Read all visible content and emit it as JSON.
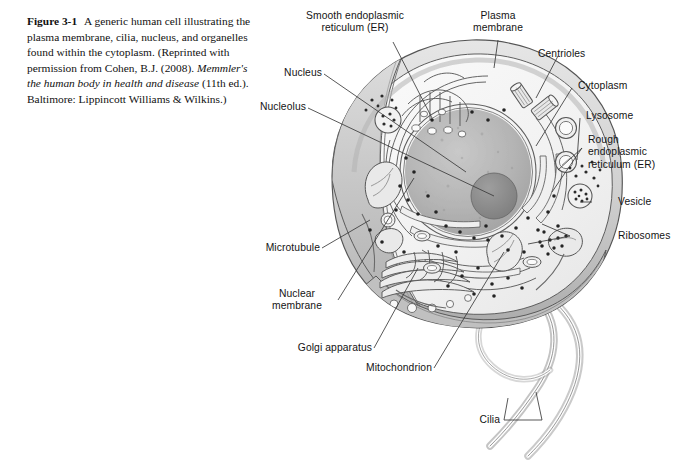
{
  "figure": {
    "number": "Figure 3-1",
    "caption_text": "A generic human cell illustrating the plasma membrane, cilia, nucleus, and organelles found within the cytoplasm. (Reprinted with permission from Cohen, B.J. (2008). ",
    "caption_italic": "Memmler's the human body in health and disease",
    "caption_tail": " (11th ed.). Baltimore: Lippincott Williams & Wilkins.)",
    "alt": "Grayscale illustration of a generic human cell in cross-section showing the nucleus, nucleolus, endoplasmic reticulum, Golgi apparatus, mitochondria, lysosomes, centrioles, ribosomes, vesicles, microtubules and cilia."
  },
  "labels": {
    "smooth_er": "Smooth endoplasmic\nreticulum (ER)",
    "smooth_er_l1": "Smooth endoplasmic",
    "smooth_er_l2": "reticulum (ER)",
    "plasma_membrane_l1": "Plasma",
    "plasma_membrane_l2": "membrane",
    "centrioles": "Centrioles",
    "cytoplasm": "Cytoplasm",
    "lysosome": "Lysosome",
    "rough_er_l1": "Rough",
    "rough_er_l2": "endoplasmic",
    "rough_er_l3": "reticulum (ER)",
    "vesicle": "Vesicle",
    "ribosomes": "Ribosomes",
    "cilia": "Cilia",
    "mitochondrion": "Mitochondrion",
    "golgi": "Golgi apparatus",
    "nuclear_membrane_l1": "Nuclear",
    "nuclear_membrane_l2": "membrane",
    "microtubule": "Microtubule",
    "nucleolus": "Nucleolus",
    "nucleus": "Nucleus"
  },
  "colors": {
    "background": "#ffffff",
    "ink": "#141414",
    "outline": "#4a4a4a",
    "cytoplasm_fill": "#f2f2f2",
    "membrane_fill": "#d8d8d8",
    "nucleus_fill": "#b9b9b9",
    "nucleolus_fill": "#8f8f8f",
    "organelle_fill": "#e4e4e4",
    "shadow": "#9a9a9a"
  }
}
